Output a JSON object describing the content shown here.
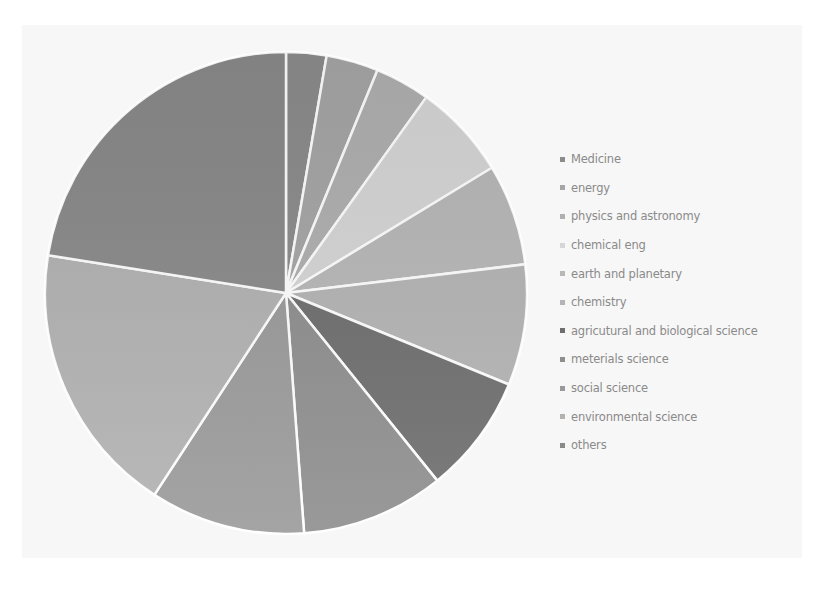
{
  "chart_data": {
    "type": "pie",
    "title": "",
    "start_angle_deg": 0,
    "direction": "clockwise",
    "legend_position": "right",
    "categories": [
      "Medicine",
      "energy",
      "physics and astronomy",
      "chemical eng",
      "earth and planetary",
      "chemistry",
      "agricutural and biological science",
      "meterials science",
      "social science",
      "environmental science",
      "others"
    ],
    "values": [
      2.7,
      3.5,
      3.7,
      6.4,
      6.8,
      8.1,
      8.0,
      9.6,
      10.4,
      18.3,
      22.5
    ],
    "colors": [
      "#8c8c8c",
      "#a6a6a6",
      "#b0b0b0",
      "#d6d6d6",
      "#b8b8b8",
      "#b4b4b4",
      "#6e6e6e",
      "#8e8e8e",
      "#9a9a9a",
      "#b2b2b2",
      "#8a8a8a"
    ],
    "value_units": "percent (estimated from slice angles)"
  },
  "legend": {
    "items": [
      {
        "label": "Medicine",
        "color": "#8c8c8c"
      },
      {
        "label": "energy",
        "color": "#a6a6a6"
      },
      {
        "label": "physics and astronomy",
        "color": "#b0b0b0"
      },
      {
        "label": "chemical eng",
        "color": "#d6d6d6"
      },
      {
        "label": "earth and planetary",
        "color": "#b8b8b8"
      },
      {
        "label": "chemistry",
        "color": "#b4b4b4"
      },
      {
        "label": "agricutural and biological science",
        "color": "#6e6e6e"
      },
      {
        "label": "meterials science",
        "color": "#8e8e8e"
      },
      {
        "label": "social science",
        "color": "#9a9a9a"
      },
      {
        "label": "environmental science",
        "color": "#b2b2b2"
      },
      {
        "label": "others",
        "color": "#8a8a8a"
      }
    ]
  },
  "pie_geometry": {
    "cx": 286,
    "cy": 293,
    "r": 241,
    "separator_color": "#ffffff"
  }
}
